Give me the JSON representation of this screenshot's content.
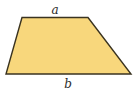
{
  "figure": {
    "shape": "trapezoid",
    "fill_color": "#F8D77C",
    "stroke_color": "#3a3320",
    "vertices": {
      "top_left": [
        22,
        17.5
      ],
      "top_right": [
        88,
        17.5
      ],
      "bottom_right": [
        131,
        74
      ],
      "bottom_left": [
        6,
        74
      ]
    },
    "labels": {
      "top": "a",
      "bottom": "b"
    }
  }
}
